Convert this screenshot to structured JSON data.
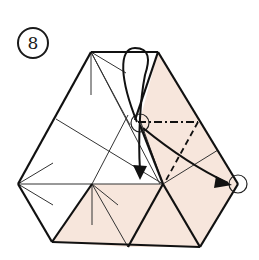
{
  "step": {
    "number": "8"
  },
  "colors": {
    "paper_back": "#f7e6dc",
    "paper_front": "#ffffff",
    "line": "#1a1a1a",
    "thin_line": "#333333"
  },
  "symbols": {
    "fold_arrow_1": "curved-arrow-down",
    "fold_arrow_2": "straight-arrow-right",
    "valley_fold": "dashed-line",
    "mountain_fold": "dash-dot-line",
    "reference_points": [
      "circle-marker-top",
      "circle-marker-right"
    ]
  }
}
